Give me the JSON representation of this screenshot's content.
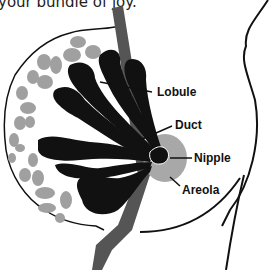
{
  "caption": "your bundle of joy.",
  "labels": {
    "lobule": "Lobule",
    "duct": "Duct",
    "nipple": "Nipple",
    "areola": "Areola"
  },
  "colors": {
    "gland": "#111111",
    "fat_tissue": "#a0a0a0",
    "chest_wall": "#555555",
    "areola": "#a8a8a8",
    "outline": "#111111"
  }
}
